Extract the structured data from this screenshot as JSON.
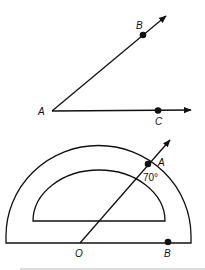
{
  "figure_top": {
    "description": "Angle BAC formed by rays AB and AC",
    "labels": {
      "vertex": "A",
      "ray1_point": "B",
      "ray2_point": "C"
    }
  },
  "figure_bottom": {
    "description": "Protractor measuring angle AOB",
    "labels": {
      "center": "O",
      "ray_point": "A",
      "base_point": "B"
    },
    "angle_reading": "70°",
    "angle_value_degrees": 70
  },
  "colors": {
    "ink": "#111111",
    "background": "#ffffff",
    "rule": "#bbbbbb"
  }
}
